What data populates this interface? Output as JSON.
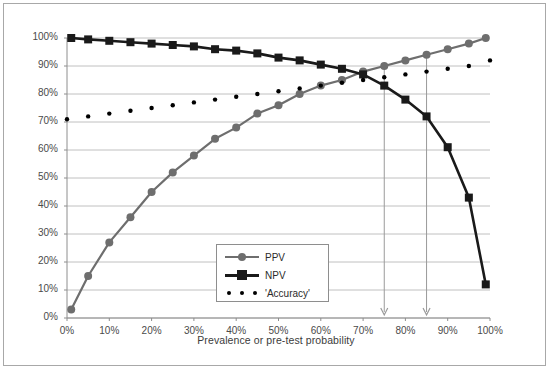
{
  "figure": {
    "background": "#ffffff",
    "border_color": "#a8a8a8"
  },
  "axis_title_x": "Prevalence or pre-test probability",
  "legend": {
    "items": [
      {
        "label": "PPV",
        "marker": "circle-marker-icon",
        "color": "#6e6e6e",
        "style": "solid"
      },
      {
        "label": "NPV",
        "marker": "square-marker-icon",
        "color": "#1a1a1a",
        "style": "solid"
      },
      {
        "label": "'Accuracy'",
        "marker": "dot-marker-icon",
        "color": "#000000",
        "style": "dotted"
      }
    ]
  },
  "annotations": [
    {
      "name": "arrow-75",
      "x": 75,
      "label": ""
    },
    {
      "name": "arrow-85",
      "x": 85,
      "label": ""
    }
  ],
  "chart_data": {
    "type": "line",
    "title": "",
    "subtitle": "",
    "xlabel": "Prevalence or pre-test probability",
    "ylabel": "",
    "xlim": [
      0,
      100
    ],
    "ylim": [
      0,
      100
    ],
    "grid": "horizontal",
    "legend_position": "inside-bottom-center",
    "xticks": [
      "0%",
      "10%",
      "20%",
      "30%",
      "40%",
      "50%",
      "60%",
      "70%",
      "80%",
      "90%",
      "100%"
    ],
    "xtick_values": [
      0,
      10,
      20,
      30,
      40,
      50,
      60,
      70,
      80,
      90,
      100
    ],
    "yticks": [
      "0%",
      "10%",
      "20%",
      "30%",
      "40%",
      "50%",
      "60%",
      "70%",
      "80%",
      "90%",
      "100%"
    ],
    "ytick_values": [
      0,
      10,
      20,
      30,
      40,
      50,
      60,
      70,
      80,
      90,
      100
    ],
    "series": [
      {
        "name": "PPV",
        "color": "#6e6e6e",
        "marker": "circle",
        "style": "solid",
        "x": [
          1,
          5,
          10,
          15,
          20,
          25,
          30,
          35,
          40,
          45,
          50,
          55,
          60,
          65,
          70,
          75,
          80,
          85,
          90,
          95,
          99
        ],
        "values": [
          3,
          15,
          27,
          36,
          45,
          52,
          58,
          64,
          68,
          73,
          76,
          80,
          83,
          85,
          88,
          90,
          92,
          94,
          96,
          98,
          100
        ]
      },
      {
        "name": "NPV",
        "color": "#1a1a1a",
        "marker": "square",
        "style": "solid",
        "x": [
          1,
          5,
          10,
          15,
          20,
          25,
          30,
          35,
          40,
          45,
          50,
          55,
          60,
          65,
          70,
          75,
          80,
          85,
          90,
          95,
          99
        ],
        "values": [
          100,
          99.5,
          99,
          98.5,
          98,
          97.5,
          97,
          96,
          95.5,
          94.5,
          93,
          92,
          90.5,
          89,
          87,
          83,
          78,
          72,
          61,
          43,
          12
        ]
      },
      {
        "name": "'Accuracy'",
        "color": "#000000",
        "marker": "dot",
        "style": "dotted",
        "x": [
          0,
          5,
          10,
          15,
          20,
          25,
          30,
          35,
          40,
          45,
          50,
          55,
          60,
          65,
          70,
          75,
          80,
          85,
          90,
          95,
          100
        ],
        "values": [
          71,
          72,
          73,
          74,
          75,
          76,
          77,
          78,
          79,
          80,
          81,
          82,
          83,
          84,
          85,
          86,
          87,
          88,
          89,
          90,
          92
        ]
      }
    ],
    "annotations": [
      {
        "type": "vline-arrow",
        "x": 75,
        "from_y": 90,
        "to_y": 0
      },
      {
        "type": "vline-arrow",
        "x": 85,
        "from_y": 94,
        "to_y": 0
      }
    ]
  }
}
